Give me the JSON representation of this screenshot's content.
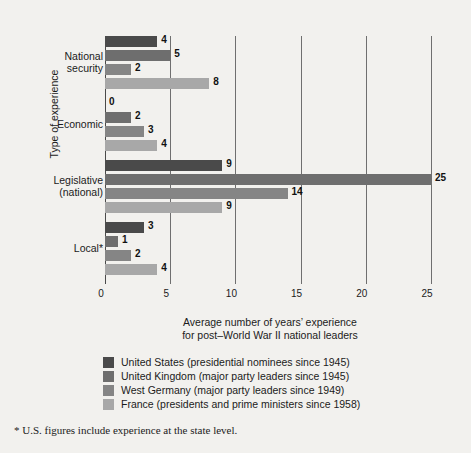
{
  "chart_data": {
    "type": "bar",
    "orientation": "horizontal",
    "title": "",
    "xlabel": "Average number of years' experience for post–World War II national leaders",
    "xlabel_line1": "Average number of years’ experience",
    "xlabel_line2": "for post–World War II national leaders",
    "ylabel": "Type of experience",
    "xlim": [
      0,
      25
    ],
    "xticks": [
      0,
      5,
      10,
      15,
      20,
      25
    ],
    "xtick_labels": [
      "0",
      "5",
      "10",
      "15",
      "20",
      "25"
    ],
    "grid": "vertical",
    "legend_position": "below",
    "categories": [
      "National security",
      "Economic",
      "Legislative (national)",
      "Local*"
    ],
    "category_lines": [
      [
        "National",
        "security"
      ],
      [
        "Economic"
      ],
      [
        "Legislative",
        "(national)"
      ],
      [
        "Local*"
      ]
    ],
    "series": [
      {
        "name": "United States (presidential nominees since 1945)",
        "short": "United States",
        "color": "#4a4a4a",
        "values": [
          4,
          0,
          9,
          3
        ]
      },
      {
        "name": "United Kingdom (major party leaders since 1945)",
        "short": "United Kingdom",
        "color": "#6e6e6e",
        "values": [
          5,
          2,
          25,
          1
        ]
      },
      {
        "name": "West Germany (major party leaders since 1949)",
        "short": "West Germany",
        "color": "#858585",
        "values": [
          2,
          3,
          14,
          2
        ]
      },
      {
        "name": "France (presidents and prime ministers since 1958)",
        "short": "France",
        "color": "#a8a8a8",
        "values": [
          8,
          4,
          9,
          4
        ]
      }
    ],
    "value_labels": [
      [
        "4",
        "5",
        "2",
        "8"
      ],
      [
        "0",
        "2",
        "3",
        "4"
      ],
      [
        "9",
        "25",
        "14",
        "9"
      ],
      [
        "3",
        "1",
        "2",
        "4"
      ]
    ]
  },
  "legend": {
    "items": [
      {
        "label": "United States (presidential nominees since 1945)",
        "color": "#4a4a4a"
      },
      {
        "label": "United Kingdom (major party leaders since 1945)",
        "color": "#6e6e6e"
      },
      {
        "label": "West Germany (major party leaders since 1949)",
        "color": "#858585"
      },
      {
        "label": "France (presidents and prime ministers since 1958)",
        "color": "#a8a8a8"
      }
    ]
  },
  "footnote": {
    "text": "* U.S. figures include experience at the state level."
  },
  "colors": {
    "background": "#f2f1ee",
    "gridline": "#6f6f6f",
    "axis": "#4a4a4a",
    "text": "#1b1b1b"
  }
}
